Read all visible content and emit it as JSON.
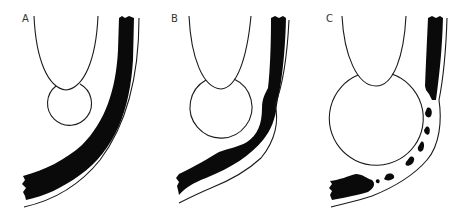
{
  "figure": {
    "colors": {
      "ink": "#0a0a0a",
      "outline": "#1a1a1a",
      "background": "#ffffff",
      "label": "#333333"
    },
    "panels": [
      {
        "label": "A",
        "stage": "small bulb, continuous thick black layer"
      },
      {
        "label": "B",
        "stage": "larger bulb, black layer thinned and indented"
      },
      {
        "label": "C",
        "stage": "largest bulb, black layer fragmented into patches"
      }
    ]
  }
}
